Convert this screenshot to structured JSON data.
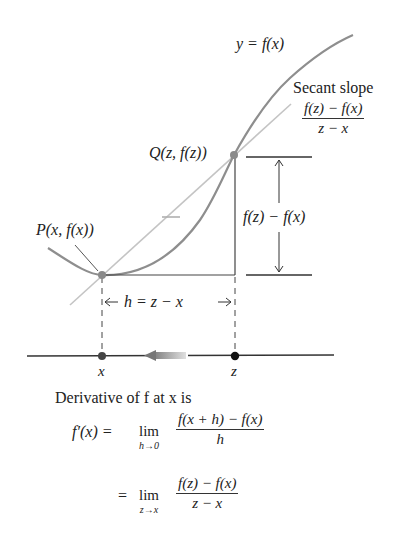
{
  "figure": {
    "curve_label": "y = f(x)",
    "secant_label": "Secant slope",
    "secant_fraction": {
      "numerator": "f(z) − f(x)",
      "denominator": "z − x"
    },
    "point_p_label": "P(x, f(x))",
    "point_q_label": "Q(z, f(z))",
    "rise_label": "f(z) − f(x)",
    "run_label": "h = z − x",
    "axis_x_label": "x",
    "axis_z_label": "z"
  },
  "caption": {
    "intro": "Derivative of f at x is",
    "line1": {
      "lhs": "f′(x) =",
      "lim_word": "lim",
      "lim_sub": "h→0",
      "numerator": "f(x + h) − f(x)",
      "denominator": "h"
    },
    "line2": {
      "lhs": "=",
      "lim_word": "lim",
      "lim_sub": "z→x",
      "numerator": "f(z) − f(x)",
      "denominator": "z − x"
    }
  },
  "colors": {
    "curve": "#8a8a8a",
    "secant": "#bdbdbd",
    "ink": "#222222",
    "arrow_gradient": [
      "#888888",
      "#dddddd"
    ]
  }
}
